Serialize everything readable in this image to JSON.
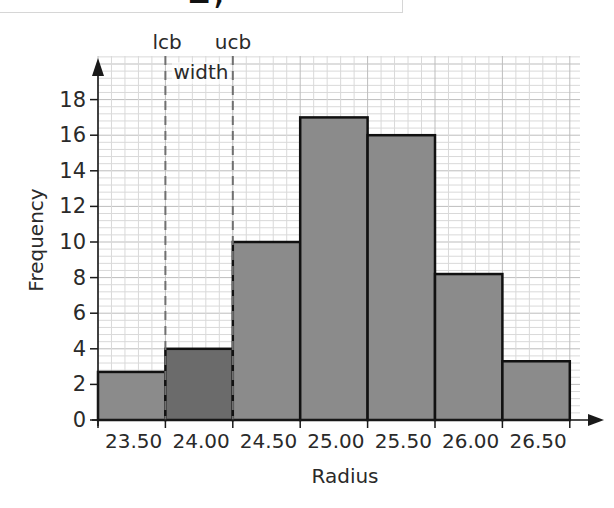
{
  "top_fragment": {
    "text": "2,"
  },
  "colors": {
    "bar_fill": "#8b8b8b",
    "highlight_bar_fill": "#6b6b6b",
    "bar_stroke": "#111111",
    "grid_minor": "#d9d9d9",
    "grid_major": "#bdbdbd",
    "axis": "#1a1a1a",
    "dashed_line": "#707070"
  },
  "chart_data": {
    "type": "bar",
    "subtype": "histogram",
    "title": "",
    "xlabel": "Radius",
    "ylabel": "Frequency",
    "categories": [
      "23.50",
      "24.00",
      "24.50",
      "25.00",
      "25.50",
      "26.00",
      "26.50"
    ],
    "values": [
      2.7,
      4,
      10,
      17,
      16,
      8.2,
      3.3
    ],
    "highlighted_index": 1,
    "ylim": [
      0,
      19
    ],
    "yticks": [
      0,
      2,
      4,
      6,
      8,
      10,
      12,
      14,
      16,
      18
    ],
    "grid": true,
    "legend": null,
    "annotations": [
      {
        "text": "lcb",
        "position": "lower class boundary of 24.00 bar"
      },
      {
        "text": "ucb",
        "position": "upper class boundary of 24.00 bar"
      },
      {
        "text": "width",
        "position": "between lcb and ucb dashed lines"
      }
    ]
  }
}
